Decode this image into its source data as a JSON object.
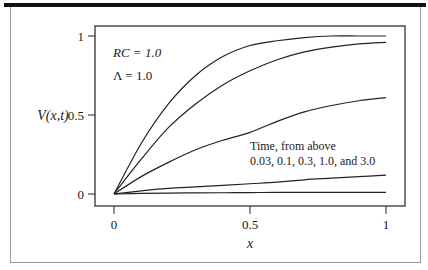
{
  "chart_data": {
    "type": "line",
    "title": "",
    "xlabel": "x",
    "ylabel": "V(x,t)",
    "xlim": [
      0,
      1
    ],
    "ylim": [
      0,
      1
    ],
    "x_ticks": [
      "0",
      "0.5",
      "1"
    ],
    "y_ticks": [
      "0",
      "0.5",
      "1"
    ],
    "grid": false,
    "legend": null,
    "annotations": [
      "RC = 1.0",
      "Λ = 1.0",
      "Time, from above",
      "0.03, 0.1, 0.3, 1.0, and 3.0"
    ],
    "x": [
      0,
      0.1,
      0.2,
      0.3,
      0.4,
      0.5,
      0.6,
      0.7,
      0.8,
      0.9,
      1.0
    ],
    "series": [
      {
        "name": "t = 0.03",
        "values": [
          0,
          0.32,
          0.57,
          0.75,
          0.87,
          0.94,
          0.97,
          0.99,
          1.0,
          1.0,
          1.0
        ]
      },
      {
        "name": "t = 0.1",
        "values": [
          0,
          0.22,
          0.42,
          0.57,
          0.69,
          0.78,
          0.85,
          0.9,
          0.93,
          0.95,
          0.96
        ]
      },
      {
        "name": "t = 0.3",
        "values": [
          0,
          0.11,
          0.2,
          0.28,
          0.34,
          0.39,
          0.46,
          0.52,
          0.56,
          0.59,
          0.61
        ]
      },
      {
        "name": "t = 1.0",
        "values": [
          0,
          0.02,
          0.035,
          0.045,
          0.055,
          0.065,
          0.075,
          0.09,
          0.1,
          0.11,
          0.12
        ]
      },
      {
        "name": "t = 3.0",
        "values": [
          0,
          0.004,
          0.006,
          0.007,
          0.008,
          0.009,
          0.01,
          0.01,
          0.01,
          0.01,
          0.01
        ]
      }
    ]
  },
  "labels": {
    "ylabel": "V(x,t)",
    "xlabel": "x",
    "param_rc": "RC = 1.0",
    "param_lambda": "Λ = 1.0",
    "time_label": "Time, from above",
    "time_values": "0.03, 0.1, 0.3, 1.0, and 3.0"
  }
}
